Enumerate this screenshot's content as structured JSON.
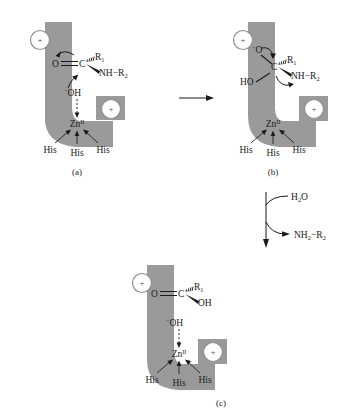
{
  "figure": {
    "enzyme_color": "#9a9a9a",
    "ink_color": "#1a1a1a",
    "background": "#ffffff"
  },
  "panels": [
    {
      "id": "a",
      "label": "(a)",
      "charges": [
        "+",
        "+"
      ],
      "metal": {
        "symbol": "Zn",
        "oxidation": "II"
      },
      "ligands": [
        "His",
        "His",
        "His"
      ],
      "nucleophile": {
        "charge": "−",
        "text": "OH"
      },
      "substrate": {
        "carbonyl_oxygen": "O",
        "carbon": "C",
        "wedge_hash_group": "R",
        "wedge_hash_sub": "1",
        "wedge_solid_group": "NH−R",
        "wedge_solid_sub": "2"
      }
    },
    {
      "id": "b",
      "label": "(b)",
      "charges": [
        "+",
        "+"
      ],
      "metal": {
        "symbol": "Zn",
        "oxidation": "II"
      },
      "ligands": [
        "His",
        "His",
        "His"
      ],
      "intermediate": {
        "oxyanion_charge": "−",
        "oxyanion": "O",
        "hydroxyl": "HO",
        "carbon": "C",
        "wedge_hash_group": "R",
        "wedge_hash_sub": "1",
        "wedge_solid_group": "NH−R",
        "wedge_solid_sub": "2"
      }
    },
    {
      "id": "c",
      "label": "(c)",
      "charges": [
        "+",
        "+"
      ],
      "metal": {
        "symbol": "Zn",
        "oxidation": "II"
      },
      "ligands": [
        "His",
        "His",
        "His"
      ],
      "nucleophile": {
        "charge": "−",
        "text": "OH"
      },
      "product": {
        "carbonyl_oxygen": "O",
        "carbon": "C",
        "wedge_hash_group": "R",
        "wedge_hash_sub": "1",
        "wedge_solid_group": "OH"
      }
    }
  ],
  "reagents": {
    "water_in": {
      "formula": "H",
      "sub": "2",
      "tail": "O"
    },
    "amine_out": {
      "formula": "NH",
      "sub": "2",
      "tail": "−R",
      "tail_sub": "2"
    }
  }
}
